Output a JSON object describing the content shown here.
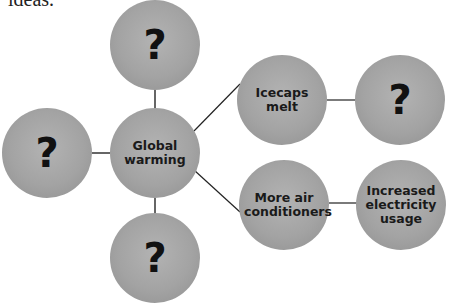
{
  "caption": "ideas.",
  "diagram": {
    "type": "concept-web",
    "node_color": "#a6a6a6",
    "line_color": "#222222",
    "nodes": [
      {
        "id": "center",
        "label": "Global warming"
      },
      {
        "id": "top",
        "label": "?"
      },
      {
        "id": "left",
        "label": "?"
      },
      {
        "id": "bottom",
        "label": "?"
      },
      {
        "id": "icecaps",
        "label": "Icecaps melt"
      },
      {
        "id": "icecaps-effect",
        "label": "?"
      },
      {
        "id": "ac",
        "label": "More air conditioners"
      },
      {
        "id": "electricity",
        "label": "Increased electricity usage"
      }
    ],
    "edges": [
      [
        "center",
        "top"
      ],
      [
        "center",
        "left"
      ],
      [
        "center",
        "bottom"
      ],
      [
        "center",
        "icecaps"
      ],
      [
        "center",
        "ac"
      ],
      [
        "icecaps",
        "icecaps-effect"
      ],
      [
        "ac",
        "electricity"
      ]
    ]
  }
}
